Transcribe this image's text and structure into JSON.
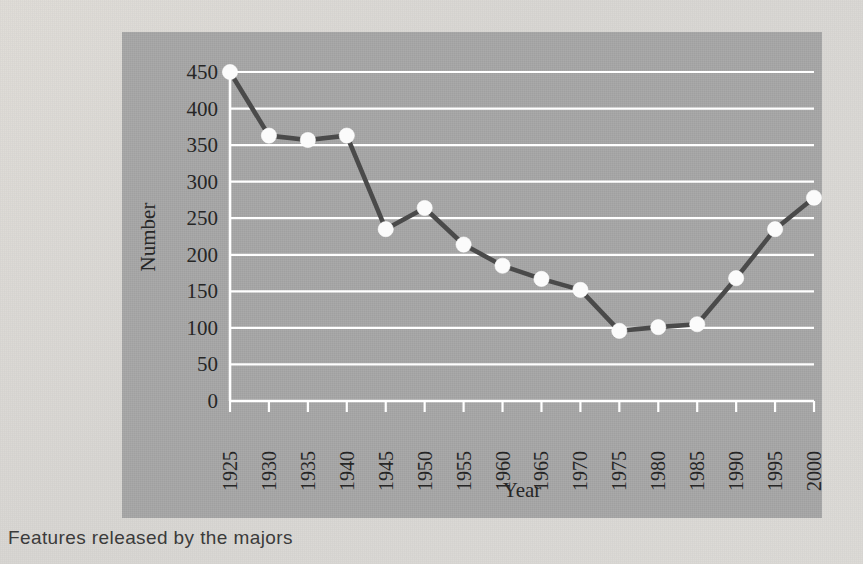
{
  "caption": "Features released by the majors",
  "chart_data": {
    "type": "line",
    "title": "",
    "xlabel": "Year",
    "ylabel": "Number",
    "categories": [
      "1925",
      "1930",
      "1935",
      "1940",
      "1945",
      "1950",
      "1955",
      "1960",
      "1965",
      "1970",
      "1975",
      "1980",
      "1985",
      "1990",
      "1995",
      "2000"
    ],
    "x": [
      1925,
      1930,
      1935,
      1940,
      1945,
      1950,
      1955,
      1960,
      1965,
      1970,
      1975,
      1980,
      1985,
      1990,
      1995,
      2000
    ],
    "values": [
      450,
      363,
      357,
      363,
      235,
      264,
      214,
      185,
      167,
      152,
      96,
      101,
      105,
      168,
      235,
      278
    ],
    "series": [
      {
        "name": "Number",
        "values": [
          450,
          363,
          357,
          363,
          235,
          264,
          214,
          185,
          167,
          152,
          96,
          101,
          105,
          168,
          235,
          278
        ]
      }
    ],
    "ylim": [
      0,
      450
    ],
    "yticks": [
      0,
      50,
      100,
      150,
      200,
      250,
      300,
      350,
      400,
      450
    ],
    "ytick_labels": [
      "0",
      "50",
      "100",
      "150",
      "200",
      "250",
      "300",
      "350",
      "400",
      "450"
    ],
    "xlim": [
      1925,
      2000
    ],
    "grid": "horizontal",
    "legend": "none",
    "marker": "circle",
    "colors": {
      "panel_background": "#a6a6a6",
      "page_background": "#d9d9d6",
      "line": "#4a4a4a",
      "marker_fill": "#fbfbfb",
      "gridline": "#ffffff",
      "text": "#262626"
    }
  }
}
